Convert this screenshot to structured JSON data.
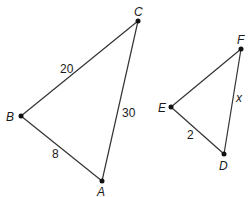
{
  "diagram": {
    "triangle_1": {
      "vertices": {
        "A": {
          "label": "A",
          "x": 102,
          "y": 181
        },
        "B": {
          "label": "B",
          "x": 21,
          "y": 116
        },
        "C": {
          "label": "C",
          "x": 138,
          "y": 21
        }
      },
      "sides": {
        "BC": "20",
        "AC": "30",
        "AB": "8"
      }
    },
    "triangle_2": {
      "vertices": {
        "D": {
          "label": "D",
          "x": 224,
          "y": 154
        },
        "E": {
          "label": "E",
          "x": 171,
          "y": 107
        },
        "F": {
          "label": "F",
          "x": 241,
          "y": 49
        }
      },
      "sides": {
        "DF": "x",
        "DE": "2"
      }
    }
  }
}
